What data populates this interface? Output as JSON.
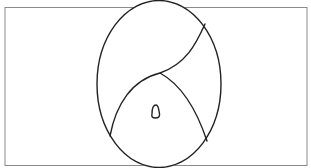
{
  "diagram": {
    "type": "venn-like region diagram",
    "colors": {
      "background": "#ffffff",
      "frame_stroke": "#8a8a8a",
      "shape_stroke": "#222222"
    },
    "elements": [
      {
        "name": "outer-rectangle",
        "kind": "rectangle"
      },
      {
        "name": "large-ellipse",
        "kind": "ellipse"
      },
      {
        "name": "s-curve-divider",
        "kind": "curve"
      },
      {
        "name": "right-arc-divider",
        "kind": "curve"
      },
      {
        "name": "small-loop",
        "kind": "closed-curve"
      }
    ],
    "labels": []
  }
}
